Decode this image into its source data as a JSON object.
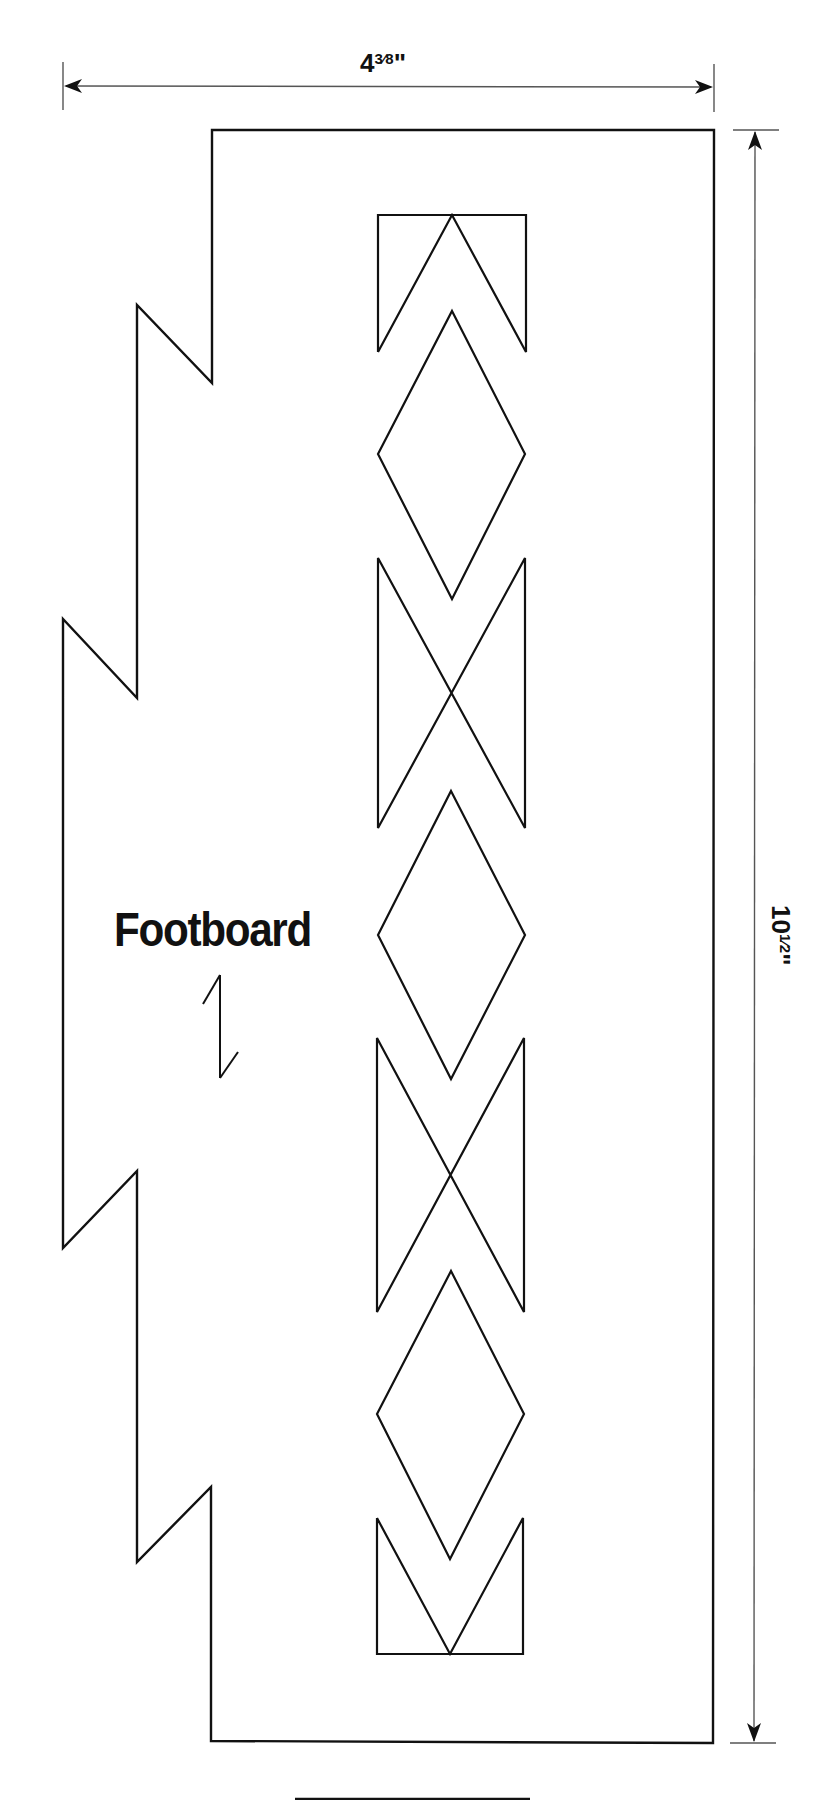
{
  "diagram": {
    "type": "woodworking-pattern",
    "part_label": "Footboard",
    "dimensions": {
      "width": {
        "whole": "4",
        "fraction": "3⁄8",
        "unit": "\"",
        "display": "4⅜\""
      },
      "height": {
        "whole": "10",
        "fraction": "1⁄2",
        "unit": "\"",
        "display": "10½\""
      }
    },
    "grain_direction": "vertical",
    "pattern_sequence": [
      "top-chevron-bracket",
      "diamond",
      "hourglass",
      "diamond",
      "hourglass",
      "diamond",
      "bottom-chevron-bracket"
    ],
    "colors": {
      "line": "#111111",
      "dimension_line": "#555555",
      "background": "#ffffff"
    }
  }
}
